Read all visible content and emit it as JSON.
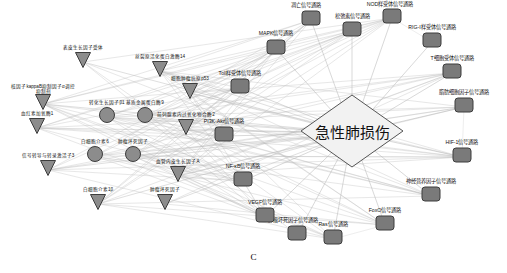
{
  "figure": {
    "caption": "C",
    "background": "#ffffff",
    "edge_color": "#b9b9b9",
    "node_fill_gene": "#8c8c8c",
    "node_fill_pathway": "#7a7a7a",
    "node_stroke": "#3d3d3d",
    "hub_fill": "#f2f2f2",
    "hub_stroke": "#555555"
  },
  "hub": {
    "label": "急性肺损伤",
    "shape": "diamond",
    "x": 352,
    "y": 133,
    "w": 104,
    "h": 74,
    "font_size": 15
  },
  "genes": [
    {
      "label": "血红素加氧酶1",
      "x": 37,
      "y": 128,
      "shape": "vee",
      "size": 17,
      "font_size": 4.6,
      "lw": 46
    },
    {
      "label": "核因子kappaB抑制因子α调控抑制剂",
      "x": 43,
      "y": 104,
      "shape": "vee",
      "size": 17,
      "font_size": 4.6,
      "lw": 68
    },
    {
      "label": "表皮生长因子受体",
      "x": 83,
      "y": 62,
      "shape": "vee",
      "size": 17,
      "font_size": 4.6,
      "lw": 46
    },
    {
      "label": "转化生长因子β1",
      "x": 107,
      "y": 117,
      "shape": "circle",
      "size": 17,
      "font_size": 4.6,
      "lw": 40
    },
    {
      "label": "基质金属蛋白酶9",
      "x": 145,
      "y": 117,
      "shape": "circle",
      "size": 17,
      "font_size": 4.6,
      "lw": 40
    },
    {
      "label": "白细胞介素6",
      "x": 95,
      "y": 156,
      "shape": "circle",
      "size": 17,
      "font_size": 4.6,
      "lw": 36
    },
    {
      "label": "肿瘤坏死因子",
      "x": 133,
      "y": 156,
      "shape": "circle",
      "size": 17,
      "font_size": 4.6,
      "lw": 36
    },
    {
      "label": "信号转导与转录激活子3",
      "x": 48,
      "y": 170,
      "shape": "vee",
      "size": 17,
      "font_size": 4.6,
      "lw": 54
    },
    {
      "label": "白细胞介素1β",
      "x": 98,
      "y": 204,
      "shape": "vee",
      "size": 17,
      "font_size": 4.6,
      "lw": 38
    },
    {
      "label": "肿瘤坏死因子",
      "x": 165,
      "y": 204,
      "shape": "vee",
      "size": 17,
      "font_size": 4.6,
      "lw": 38
    },
    {
      "label": "血管内皮生长因子A",
      "x": 178,
      "y": 176,
      "shape": "vee",
      "size": 17,
      "font_size": 4.6,
      "lw": 50
    },
    {
      "label": "前列腺素内过氧化物合酶2",
      "x": 186,
      "y": 129,
      "shape": "vee",
      "size": 17,
      "font_size": 4.6,
      "lw": 58
    },
    {
      "label": "细胞肿瘤抗原p53",
      "x": 190,
      "y": 93,
      "shape": "vee",
      "size": 17,
      "font_size": 4.6,
      "lw": 46
    },
    {
      "label": "丝裂原活化蛋白激酶14",
      "x": 160,
      "y": 71,
      "shape": "vee",
      "size": 17,
      "font_size": 4.6,
      "lw": 56
    }
  ],
  "pathways": [
    {
      "label": "MAPK信号通路",
      "x": 276,
      "y": 49,
      "shape": "roundrect",
      "w": 20,
      "h": 16,
      "font_size": 5.2,
      "lw": 46,
      "label_dx": 0,
      "label_dy": -15
    },
    {
      "label": "凋亡信号通路",
      "x": 311,
      "y": 20,
      "shape": "roundrect",
      "w": 20,
      "h": 16,
      "font_size": 5.2,
      "lw": 40,
      "label_dx": -5,
      "label_dy": -14
    },
    {
      "label": "松弛素信号通路",
      "x": 352,
      "y": 31,
      "shape": "roundrect",
      "w": 20,
      "h": 16,
      "font_size": 5.2,
      "lw": 44,
      "label_dx": 0,
      "label_dy": -14
    },
    {
      "label": "NOD样受体信号通路",
      "x": 392,
      "y": 18,
      "shape": "roundrect",
      "w": 20,
      "h": 16,
      "font_size": 5.2,
      "lw": 56,
      "label_dx": -2,
      "label_dy": -13
    },
    {
      "label": "RIG-I样受体信号通路",
      "x": 432,
      "y": 42,
      "shape": "roundrect",
      "w": 20,
      "h": 16,
      "font_size": 5.2,
      "lw": 58,
      "label_dx": 0,
      "label_dy": -14
    },
    {
      "label": "T细胞受体信号通路",
      "x": 452,
      "y": 73,
      "shape": "roundrect",
      "w": 20,
      "h": 16,
      "font_size": 5.2,
      "lw": 52,
      "label_dx": 0,
      "label_dy": -14
    },
    {
      "label": "脂肪细胞因子信号通路",
      "x": 464,
      "y": 107,
      "shape": "roundrect",
      "w": 20,
      "h": 16,
      "font_size": 5.2,
      "lw": 58,
      "label_dx": 0,
      "label_dy": -14
    },
    {
      "label": "HIF-1信号通路",
      "x": 462,
      "y": 157,
      "shape": "roundrect",
      "w": 20,
      "h": 16,
      "font_size": 5.2,
      "lw": 44,
      "label_dx": 0,
      "label_dy": -14
    },
    {
      "label": "神经营养因子信号通路",
      "x": 431,
      "y": 196,
      "shape": "roundrect",
      "w": 20,
      "h": 16,
      "font_size": 5.2,
      "lw": 60,
      "label_dx": 0,
      "label_dy": -14
    },
    {
      "label": "FoxO信号通路",
      "x": 385,
      "y": 225,
      "shape": "roundrect",
      "w": 20,
      "h": 16,
      "font_size": 5.2,
      "lw": 44,
      "label_dx": 0,
      "label_dy": -14
    },
    {
      "label": "Ras信号通路",
      "x": 333,
      "y": 239,
      "shape": "roundrect",
      "w": 20,
      "h": 16,
      "font_size": 5.2,
      "lw": 40,
      "label_dx": 0,
      "label_dy": -14
    },
    {
      "label": "肿瘤坏死因子信号通路",
      "x": 297,
      "y": 235,
      "shape": "roundrect",
      "w": 20,
      "h": 16,
      "font_size": 5.2,
      "lw": 60,
      "label_dx": -4,
      "label_dy": -14
    },
    {
      "label": "VEGF信号通路",
      "x": 265,
      "y": 217,
      "shape": "roundrect",
      "w": 20,
      "h": 16,
      "font_size": 5.2,
      "lw": 46,
      "label_dx": 0,
      "label_dy": -14
    },
    {
      "label": "NF-κB信号通路",
      "x": 243,
      "y": 181,
      "shape": "roundrect",
      "w": 20,
      "h": 16,
      "font_size": 5.2,
      "lw": 46,
      "label_dx": 0,
      "label_dy": -14
    },
    {
      "label": "PI3K-Akt信号通路",
      "x": 224,
      "y": 136,
      "shape": "roundrect",
      "w": 20,
      "h": 16,
      "font_size": 5.2,
      "lw": 50,
      "label_dx": 0,
      "label_dy": -14
    },
    {
      "label": "Toll样受体信号通路",
      "x": 240,
      "y": 88,
      "shape": "roundrect",
      "w": 20,
      "h": 16,
      "font_size": 5.2,
      "lw": 52,
      "label_dx": 0,
      "label_dy": -14
    }
  ]
}
